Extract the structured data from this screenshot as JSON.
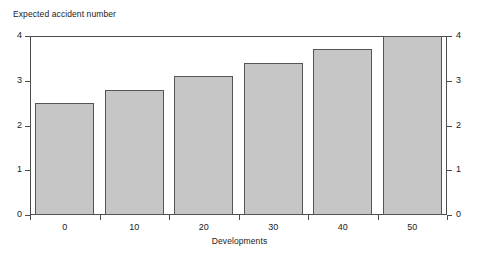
{
  "chart_data": {
    "type": "bar",
    "title": "",
    "xlabel": "Developments",
    "ylabel": "Expected accident number",
    "categories": [
      "0",
      "10",
      "20",
      "30",
      "40",
      "50"
    ],
    "values": [
      2.5,
      2.8,
      3.1,
      3.4,
      3.7,
      4.0
    ],
    "ylim": [
      0,
      4
    ],
    "yticks": [
      "0",
      "1",
      "2",
      "3",
      "4"
    ],
    "ytick_values": [
      0,
      1,
      2,
      3,
      4
    ],
    "xticks": [
      "0",
      "10",
      "20",
      "30",
      "40",
      "50"
    ],
    "grid": false,
    "legend": null,
    "right_axis": {
      "mirrored": true,
      "ticks": [
        "0",
        "1",
        "2",
        "3",
        "4"
      ]
    },
    "bar_style": {
      "fill_color": "#c6c6c6",
      "edge_color": "#555555",
      "pattern": "fine-dotted-halftone"
    },
    "frame_color": "#4d4d4d",
    "background_color": "#ffffff"
  }
}
